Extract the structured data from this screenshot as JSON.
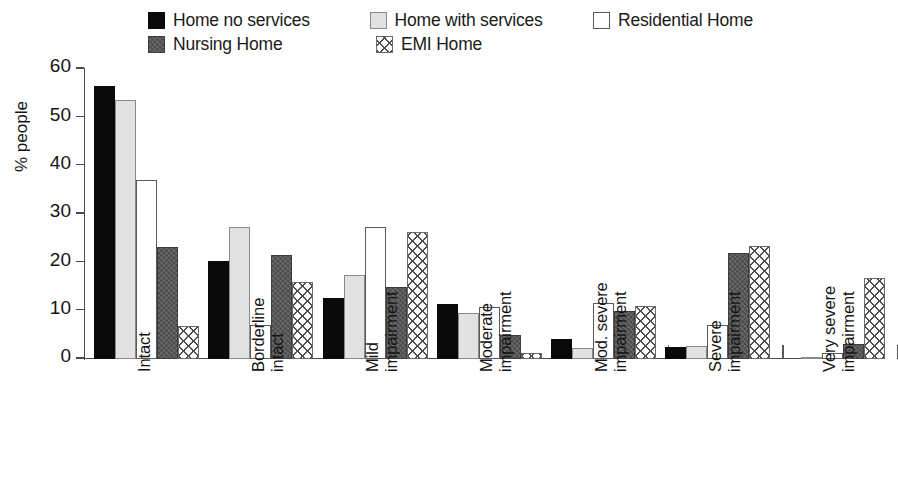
{
  "chart_data": {
    "type": "bar",
    "title": "",
    "xlabel": "",
    "ylabel": "% people",
    "ylim": [
      0,
      60
    ],
    "ytick_values": [
      0,
      10,
      20,
      30,
      40,
      50,
      60
    ],
    "ytick_labels": [
      "0",
      "10",
      "20",
      "30",
      "40",
      "50",
      "60"
    ],
    "grid": false,
    "legend_position": "top",
    "categories": [
      "Intact",
      "Borderline intact",
      "Mild impairment",
      "Moderate impairment",
      "Mod. severe impairment",
      "Severe impairment",
      "Very severe impairment"
    ],
    "category_lines": [
      [
        "Intact",
        ""
      ],
      [
        "Borderline",
        "intact"
      ],
      [
        "Mild",
        "impairment"
      ],
      [
        "Moderate",
        "impairment"
      ],
      [
        "Mod. severe",
        "impairment"
      ],
      [
        "Severe",
        "impairment"
      ],
      [
        "Very severe",
        "impairment"
      ]
    ],
    "series": [
      {
        "name": "Home no services",
        "pattern": "solid-black",
        "color": "#0a0a0a",
        "values": [
          56.5,
          20.3,
          12.5,
          11.2,
          4.1,
          2.4,
          0.0
        ]
      },
      {
        "name": "Home with services",
        "pattern": "solid-light",
        "color": "#e2e2e2",
        "values": [
          53.5,
          27.3,
          17.4,
          9.5,
          2.2,
          2.6,
          0.4
        ]
      },
      {
        "name": "Residential Home",
        "pattern": "solid-white",
        "color": "#ffffff",
        "values": [
          36.9,
          7.0,
          27.3,
          10.7,
          11.6,
          6.9,
          1.2
        ]
      },
      {
        "name": "Nursing Home",
        "pattern": "solid-dark",
        "color": "#5e5e5e",
        "values": [
          23.0,
          21.5,
          14.9,
          4.9,
          9.9,
          21.8,
          3.1
        ]
      },
      {
        "name": "EMI Home",
        "pattern": "crosshatch",
        "color": "#4d4d4d",
        "values": [
          6.7,
          15.8,
          26.1,
          1.2,
          10.9,
          23.4,
          16.6
        ]
      }
    ]
  },
  "legend": {
    "row1": [
      {
        "label": "Home no services",
        "swatch": "legend-swatch-home-no-services"
      },
      {
        "label": "Home with services",
        "swatch": "legend-swatch-home-with-services"
      },
      {
        "label": "Residential Home",
        "swatch": "legend-swatch-residential-home"
      }
    ],
    "row2": [
      {
        "label": "Nursing Home",
        "swatch": "legend-swatch-nursing-home"
      },
      {
        "label": "EMI Home",
        "swatch": "legend-swatch-emi-home"
      }
    ]
  }
}
